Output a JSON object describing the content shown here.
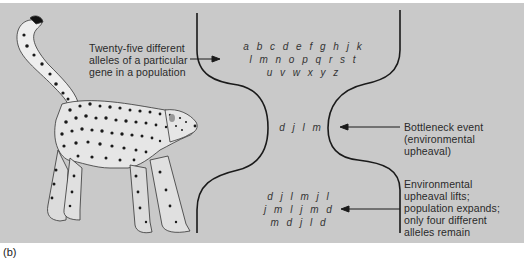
{
  "figure": {
    "caption": "(b)",
    "colors": {
      "background": "#c9c9c9",
      "line": "#1a1a1a",
      "text": "#2a2a2a"
    }
  },
  "labels": {
    "initial_population": [
      "Twenty-five different",
      "alleles of a particular",
      "gene in a population"
    ],
    "bottleneck": [
      "Bottleneck event",
      "(environmental",
      "upheaval)"
    ],
    "recovery": [
      "Environmental",
      "upheaval lifts;",
      "population expands;",
      "only four different",
      "alleles remain"
    ]
  },
  "alleles": {
    "initial": [
      "a b c d e f g h j k",
      "l m n o p q r s t",
      "u v w x y z"
    ],
    "bottleneck": [
      "d j l m"
    ],
    "final": [
      "d j l m j l",
      "j m l j m d",
      "m d j l d"
    ]
  },
  "illustration": {
    "subject": "cheetah"
  }
}
